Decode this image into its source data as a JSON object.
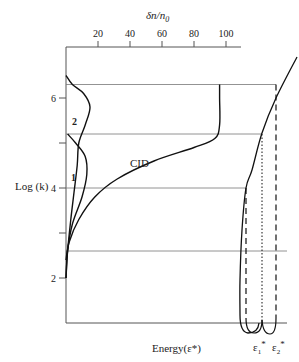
{
  "chart_data": {
    "type": "line",
    "title": "",
    "top_axis": {
      "label_main": "δn/n",
      "label_sub": "0",
      "ticks": [
        20,
        40,
        60,
        80,
        100
      ],
      "range": [
        0,
        100
      ]
    },
    "left_axis": {
      "label": "Log (k)",
      "ticks": [
        2,
        3,
        4,
        5,
        6
      ],
      "tick_labels": [
        "2",
        "",
        "4",
        "",
        "6"
      ],
      "range": [
        1.1,
        7.0
      ]
    },
    "bottom_axis": {
      "label": "Energy(ε*)",
      "markers": [
        {
          "name": "ε1",
          "label_main": "ε",
          "label_sub": "1",
          "label_sup": "*"
        },
        {
          "name": "ε2",
          "label_main": "ε",
          "label_sub": "2",
          "label_sup": "*"
        }
      ]
    },
    "reference_levels": [
      6.3,
      5.2,
      4.0,
      2.6
    ],
    "series": [
      {
        "name": "1",
        "label": "1",
        "points": [
          [
            0,
            2.0
          ],
          [
            1,
            2.6
          ],
          [
            4,
            3.2
          ],
          [
            10,
            3.8
          ],
          [
            13,
            4.3
          ],
          [
            12,
            4.7
          ],
          [
            6,
            5.0
          ],
          [
            1,
            5.2
          ]
        ]
      },
      {
        "name": "2",
        "label": "2",
        "points": [
          [
            0,
            2.0
          ],
          [
            1,
            2.6
          ],
          [
            3,
            3.3
          ],
          [
            5,
            3.9
          ],
          [
            7,
            4.5
          ],
          [
            8,
            5.0
          ],
          [
            12,
            5.4
          ],
          [
            15,
            5.8
          ],
          [
            11,
            6.1
          ],
          [
            4,
            6.3
          ],
          [
            0,
            6.5
          ]
        ]
      },
      {
        "name": "CID",
        "label": "CID",
        "points": [
          [
            0,
            2.4
          ],
          [
            2,
            2.8
          ],
          [
            8,
            3.3
          ],
          [
            18,
            3.8
          ],
          [
            32,
            4.2
          ],
          [
            55,
            4.6
          ],
          [
            80,
            4.9
          ],
          [
            93,
            5.1
          ],
          [
            96,
            5.4
          ],
          [
            96,
            6.0
          ],
          [
            96,
            6.3
          ]
        ]
      }
    ],
    "energy_curves": {
      "description": "Energy threshold curves ε1* (dotted) and ε2* (dashed) with solid energy boundary curve",
      "labels": [
        "ε1*",
        "ε2*"
      ]
    }
  }
}
